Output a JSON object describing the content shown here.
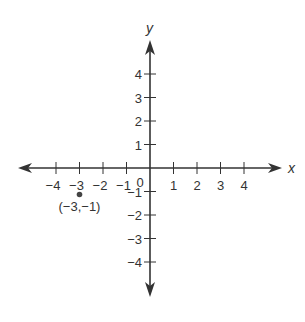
{
  "chart_data": {
    "type": "scatter",
    "title": "",
    "xlabel": "x",
    "ylabel": "y",
    "xlim": [
      -4,
      4
    ],
    "ylim": [
      -4,
      4
    ],
    "grid": false,
    "x_ticks": [
      -4,
      -3,
      -2,
      -1,
      1,
      2,
      3,
      4
    ],
    "y_ticks": [
      -4,
      -3,
      -2,
      -1,
      1,
      2,
      3,
      4
    ],
    "x_tick_labels": [
      "−4",
      "−3",
      "−2",
      "−1",
      "1",
      "2",
      "3",
      "4"
    ],
    "y_tick_labels": [
      "−4",
      "−3",
      "−2",
      "−1",
      "1",
      "2",
      "3",
      "4"
    ],
    "origin_label": "0",
    "points": [
      {
        "x": -3,
        "y": -1,
        "label": "(−3,−1)"
      }
    ]
  },
  "style": {
    "axis_color": "#333333",
    "point_color": "#444444"
  }
}
